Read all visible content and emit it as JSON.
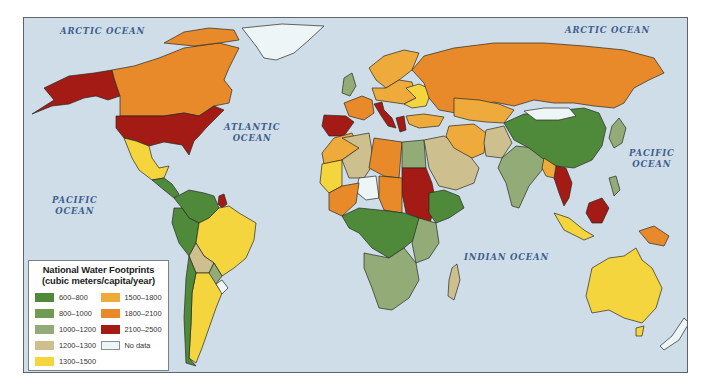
{
  "map": {
    "title": "National Water Footprints",
    "ocean_color": "#cfdde9",
    "border_color": "#2a2a22"
  },
  "legend": {
    "title": "National Water Footprints",
    "subtitle": "(cubic meters/capita/year)",
    "items": [
      {
        "label": "600–800",
        "color": "#4e8a3a"
      },
      {
        "label": "800–1000",
        "color": "#6f9b52"
      },
      {
        "label": "1000–1200",
        "color": "#93ab76"
      },
      {
        "label": "1200–1300",
        "color": "#cdc08e"
      },
      {
        "label": "1300–1500",
        "color": "#f4d53e"
      },
      {
        "label": "1500–1800",
        "color": "#eeab3c"
      },
      {
        "label": "1800–2100",
        "color": "#e98a2a"
      },
      {
        "label": "2100–2500",
        "color": "#a41a14"
      },
      {
        "label": "No data",
        "color": "#eef5f6"
      }
    ]
  },
  "ocean_labels": [
    {
      "id": "arctic-ocean-west",
      "text": "ARCTIC OCEAN",
      "x": 36,
      "y": 8
    },
    {
      "id": "arctic-ocean-east",
      "text": "ARCTIC OCEAN",
      "x": 541,
      "y": 7
    },
    {
      "id": "atlantic-ocean",
      "text": "ATLANTIC\nOCEAN",
      "x": 200,
      "y": 104
    },
    {
      "id": "pacific-ocean-east",
      "text": "PACIFIC\nOCEAN",
      "x": 605,
      "y": 130
    },
    {
      "id": "pacific-ocean-west",
      "text": "PACIFIC\nOCEAN",
      "x": 28,
      "y": 177
    },
    {
      "id": "indian-ocean",
      "text": "INDIAN OCEAN",
      "x": 440,
      "y": 234
    }
  ],
  "regions": [
    {
      "name": "alaska",
      "class": "2100–2500",
      "color": "#a41a14",
      "points": "20,70 45,58 70,55 88,52 90,60 96,78 84,82 72,78 60,80 45,86 28,88 8,96 30,82"
    },
    {
      "name": "canada",
      "class": "1800–2100",
      "color": "#e98a2a",
      "points": "88,52 110,48 135,40 160,30 195,25 215,30 205,50 200,62 208,72 205,85 190,88 175,98 160,95 140,98 110,98 96,98 96,78 90,60"
    },
    {
      "name": "canada-arctic-islands",
      "class": "1800–2100",
      "color": "#e98a2a",
      "points": "140,25 160,14 185,10 210,12 215,22 195,25 170,28"
    },
    {
      "name": "greenland",
      "class": "No data",
      "color": "#eef5f6",
      "points": "218,10 258,6 300,8 285,22 270,35 252,42 240,40 232,28"
    },
    {
      "name": "usa",
      "class": "2100–2500",
      "color": "#a41a14",
      "points": "92,98 110,98 140,98 160,95 175,98 190,88 200,92 182,110 175,118 170,123 165,137 158,127 140,124 125,128 112,123 100,120 92,110"
    },
    {
      "name": "mexico",
      "class": "1300–1500",
      "color": "#f4d53e",
      "points": "100,120 112,123 125,128 128,140 135,150 145,148 140,160 128,162 115,152 108,140"
    },
    {
      "name": "central-america",
      "class": "600–800",
      "color": "#4e8a3a",
      "points": "128,162 140,160 148,166 155,176 150,180 140,172"
    },
    {
      "name": "colombia-venezuela",
      "class": "600–800",
      "color": "#4e8a3a",
      "points": "150,180 165,172 180,175 190,178 195,190 185,200 175,205 165,200 158,190"
    },
    {
      "name": "guyana",
      "class": "2100–2500",
      "color": "#a41a14",
      "points": "195,178 200,176 203,186 198,190 194,186"
    },
    {
      "name": "peru-ecuador",
      "class": "600–800",
      "color": "#4e8a3a",
      "points": "150,190 158,190 165,200 175,205 172,225 165,238 155,225 148,205"
    },
    {
      "name": "brazil",
      "class": "1300–1500",
      "color": "#f4d53e",
      "points": "175,205 185,200 195,190 205,188 215,195 232,205 230,222 222,240 210,250 198,258 190,245 180,238 172,225"
    },
    {
      "name": "bolivia",
      "class": "1200–1300",
      "color": "#cdc08e",
      "points": "165,238 172,225 180,238 190,245 185,255 172,255"
    },
    {
      "name": "paraguay",
      "class": "1000–1200",
      "color": "#93ab76",
      "points": "185,255 190,245 198,258 192,266 186,262"
    },
    {
      "name": "argentina",
      "class": "1300–1500",
      "color": "#f4d53e",
      "points": "172,255 185,255 192,266 198,275 192,290 185,310 178,330 172,345 165,340 167,305 168,275"
    },
    {
      "name": "chile",
      "class": "600–800",
      "color": "#4e8a3a",
      "points": "165,238 172,255 168,275 167,305 165,340 172,348 162,345 160,300 162,260"
    },
    {
      "name": "uruguay",
      "class": "No data",
      "color": "#eef5f6",
      "points": "192,266 198,262 204,270 198,276"
    },
    {
      "name": "scandinavia",
      "class": "1500–1800",
      "color": "#eeab3c",
      "points": "345,50 360,38 380,32 395,35 388,52 375,62 362,70 352,62"
    },
    {
      "name": "uk",
      "class": "1000–1200",
      "color": "#93ab76",
      "points": "320,60 328,55 332,68 326,78 318,75"
    },
    {
      "name": "france",
      "class": "1800–2100",
      "color": "#e98a2a",
      "points": "320,85 338,78 348,82 350,95 340,102 325,98"
    },
    {
      "name": "spain",
      "class": "2100–2500",
      "color": "#a41a14",
      "points": "300,97 322,98 330,104 320,118 305,118 298,108"
    },
    {
      "name": "italy",
      "class": "2100–2500",
      "color": "#a41a14",
      "points": "350,86 358,84 360,92 368,100 372,110 364,108 356,96"
    },
    {
      "name": "greece",
      "class": "2100–2500",
      "color": "#a41a14",
      "points": "372,100 380,98 382,112 376,114"
    },
    {
      "name": "central-europe",
      "class": "1500–1800",
      "color": "#eeab3c",
      "points": "348,70 362,70 375,62 388,64 392,80 380,86 366,84 352,82"
    },
    {
      "name": "eastern-europe",
      "class": "1300–1500",
      "color": "#f4d53e",
      "points": "382,70 395,66 408,72 402,88 388,90 380,86 392,80"
    },
    {
      "name": "russia",
      "class": "1800–2100",
      "color": "#e98a2a",
      "points": "388,52 400,38 430,30 470,25 520,25 560,28 600,32 630,40 640,55 625,62 610,70 600,85 590,90 570,88 550,85 530,85 510,82 490,88 470,84 450,88 432,95 415,92 405,80 400,65"
    },
    {
      "name": "kazakhstan",
      "class": "1500–1800",
      "color": "#eeab3c",
      "points": "430,80 455,82 475,86 490,92 480,105 462,104 445,102 430,98"
    },
    {
      "name": "turkey",
      "class": "1500–1800",
      "color": "#eeab3c",
      "points": "382,98 400,96 420,99 415,108 395,110 385,106"
    },
    {
      "name": "north-africa-west",
      "class": "1500–1800",
      "color": "#eeab3c",
      "points": "310,120 328,115 335,130 318,142 300,146 298,135"
    },
    {
      "name": "algeria",
      "class": "1200–1300",
      "color": "#cdc08e",
      "points": "318,120 345,115 350,145 340,160 325,160 318,142 335,130"
    },
    {
      "name": "libya",
      "class": "1800–2100",
      "color": "#e98a2a",
      "points": "350,120 378,124 375,160 360,158 345,150"
    },
    {
      "name": "egypt",
      "class": "1000–1200",
      "color": "#93ab76",
      "points": "378,124 400,122 402,150 378,150"
    },
    {
      "name": "sudan",
      "class": "2100–2500",
      "color": "#a41a14",
      "points": "378,150 402,150 408,165 412,185 405,208 395,200 382,195 378,175"
    },
    {
      "name": "west-africa",
      "class": "1300–1500",
      "color": "#f4d53e",
      "points": "298,146 318,142 318,168 305,175 296,165"
    },
    {
      "name": "mali-niger",
      "class": "No data",
      "color": "#eef5f6",
      "points": "335,160 352,158 355,180 342,182 332,174"
    },
    {
      "name": "chad-region",
      "class": "1800–2100",
      "color": "#e98a2a",
      "points": "355,158 378,160 378,195 360,192 355,180"
    },
    {
      "name": "sahel-west",
      "class": "1800–2100",
      "color": "#e98a2a",
      "points": "305,175 318,168 335,165 332,185 318,198 305,192"
    },
    {
      "name": "central-africa",
      "class": "600–800",
      "color": "#4e8a3a",
      "points": "318,198 335,190 355,192 380,195 395,200 392,220 380,230 365,240 348,230 335,215 325,210"
    },
    {
      "name": "ethiopia-horn",
      "class": "600–800",
      "color": "#4e8a3a",
      "points": "405,175 420,172 435,178 440,190 425,200 412,205 405,195"
    },
    {
      "name": "east-africa",
      "class": "1000–1200",
      "color": "#93ab76",
      "points": "395,200 412,205 415,225 405,240 392,245 388,225"
    },
    {
      "name": "southern-africa",
      "class": "1000–1200",
      "color": "#93ab76",
      "points": "340,235 365,240 380,230 392,245 395,262 385,280 368,292 355,290 348,270 340,250"
    },
    {
      "name": "madagascar",
      "class": "1200–1300",
      "color": "#cdc08e",
      "points": "428,250 433,246 436,262 430,282 424,278 425,262"
    },
    {
      "name": "arabia",
      "class": "1200–1300",
      "color": "#cdc08e",
      "points": "400,122 420,118 440,130 455,150 450,165 432,172 415,168 405,150"
    },
    {
      "name": "iran",
      "class": "1500–1800",
      "color": "#eeab3c",
      "points": "425,108 450,106 462,115 460,135 448,140 430,130 422,118"
    },
    {
      "name": "afghanistan-pakistan",
      "class": "1200–1300",
      "color": "#cdc08e",
      "points": "462,112 480,108 488,125 478,140 462,138 460,125"
    },
    {
      "name": "india",
      "class": "1000–1200",
      "color": "#93ab76",
      "points": "478,140 492,128 510,130 522,140 518,152 505,168 495,190 488,188 482,165 474,150"
    },
    {
      "name": "china",
      "class": "600–800",
      "color": "#4e8a3a",
      "points": "480,105 500,96 520,95 540,92 560,90 575,95 582,110 578,128 568,142 550,150 532,148 518,140 505,130 490,122"
    },
    {
      "name": "mongolia",
      "class": "No data",
      "color": "#eef5f6",
      "points": "500,93 520,90 545,90 552,98 535,102 512,102"
    },
    {
      "name": "southeast-asia",
      "class": "2100–2500",
      "color": "#a41a14",
      "points": "532,148 542,150 548,165 545,180 540,188 535,175 530,160"
    },
    {
      "name": "myanmar-vietnam",
      "class": "1500–1800",
      "color": "#eeab3c",
      "points": "520,140 532,148 530,160 522,158 518,150"
    },
    {
      "name": "japan-korea",
      "class": "1000–1200",
      "color": "#93ab76",
      "points": "588,108 595,100 602,110 598,125 590,130 585,120"
    },
    {
      "name": "philippines",
      "class": "1000–1200",
      "color": "#93ab76",
      "points": "585,160 592,158 596,172 590,178"
    },
    {
      "name": "indonesia-west",
      "class": "1300–1500",
      "color": "#f4d53e",
      "points": "530,195 545,200 560,212 570,218 560,222 540,212"
    },
    {
      "name": "borneo",
      "class": "2100–2500",
      "color": "#a41a14",
      "points": "565,185 578,180 585,190 578,205 568,205 562,195"
    },
    {
      "name": "new-guinea",
      "class": "1800–2100",
      "color": "#e98a2a",
      "points": "615,213 630,208 645,218 640,228 625,225"
    },
    {
      "name": "australia",
      "class": "1300–1500",
      "color": "#f4d53e",
      "points": "568,250 585,240 600,238 612,230 618,242 628,250 638,270 632,290 618,305 600,300 585,292 568,295 562,278"
    },
    {
      "name": "tasmania",
      "class": "1300–1500",
      "color": "#f4d53e",
      "points": "612,310 620,308 618,318 612,318"
    },
    {
      "name": "new-zealand",
      "class": "No data",
      "color": "#eef5f6",
      "points": "660,300 665,305 655,322 640,332 636,328 648,318"
    }
  ]
}
